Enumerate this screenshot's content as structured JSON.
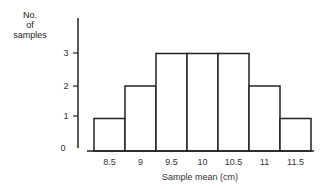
{
  "chart_data": {
    "type": "bar",
    "title": "",
    "xlabel": "Sample mean (cm)",
    "ylabel": "No. of samples",
    "ylabel_lines": [
      "No.",
      "of",
      "samples"
    ],
    "categories": [
      "8.5",
      "9",
      "9.5",
      "10",
      "10.5",
      "11",
      "11.5"
    ],
    "values": [
      1,
      2,
      3,
      3,
      3,
      2,
      1
    ],
    "yticks": [
      0,
      1,
      2,
      3
    ],
    "ylim": [
      0,
      4
    ],
    "grid": false,
    "legend": null,
    "bar_style": "histogram, white fill, black outline, adjacent bars"
  },
  "colors": {
    "stroke": "#222222",
    "fill": "#ffffff",
    "text": "#333333"
  }
}
